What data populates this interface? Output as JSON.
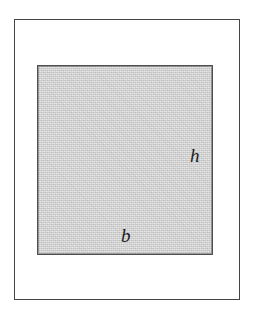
{
  "figure": {
    "name": "shaded rectangle with base and height labels",
    "background_color": "#ffffff",
    "outer_frame": {
      "stroke_color": "#4a4a4a",
      "fill": "none"
    },
    "shaded_rectangle": {
      "fill_color": "#cdcdcd",
      "stroke_color": "#4f4f4f",
      "texture": "noise-dither"
    },
    "labels": {
      "height": "h",
      "base": "b"
    }
  }
}
